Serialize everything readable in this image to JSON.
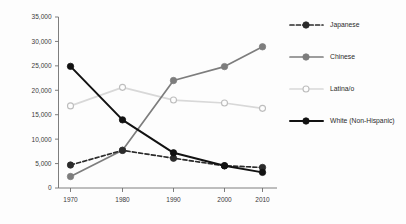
{
  "chart_data": {
    "type": "line",
    "title": "",
    "subtitle": "",
    "xlabel": "",
    "ylabel": "",
    "x": [
      1970,
      1980,
      1990,
      2000,
      2010
    ],
    "categories": [
      "1970",
      "1980",
      "1990",
      "2000",
      "2010"
    ],
    "xtick_labels": [
      "1970",
      "1980",
      "1990",
      "2000",
      "2010"
    ],
    "ytick_labels": [
      "0",
      "5,000",
      "10,000",
      "15,000",
      "20,000",
      "25,000",
      "30,000",
      "35,000"
    ],
    "ytick_values": [
      0,
      5000,
      10000,
      15000,
      20000,
      25000,
      30000,
      35000
    ],
    "ylim": [
      0,
      35000
    ],
    "xlim": [
      1965,
      2015
    ],
    "grid": false,
    "legend_position": "right",
    "series": [
      {
        "name": "Japanese",
        "values": [
          4700,
          7700,
          6100,
          4550,
          4200
        ],
        "color": "#2b2b2b",
        "style": "dashed",
        "marker": "filled-circle"
      },
      {
        "name": "Chinese",
        "values": [
          2350,
          7750,
          22000,
          24850,
          28900
        ],
        "color": "#7d7d7d",
        "style": "solid",
        "marker": "filled-circle"
      },
      {
        "name": "Latina/o",
        "values": [
          16800,
          20600,
          18000,
          17400,
          16300
        ],
        "color": "#d8d8d8",
        "style": "solid",
        "marker": "open-circle"
      },
      {
        "name": "White (Non-Hispanic)",
        "values": [
          24900,
          13950,
          7200,
          4550,
          3200
        ],
        "color": "#121212",
        "style": "solid",
        "marker": "filled-circle"
      }
    ]
  },
  "legend": {
    "items": [
      {
        "label": "Japanese"
      },
      {
        "label": "Chinese"
      },
      {
        "label": "Latina/o"
      },
      {
        "label": "White (Non-Hispanic)"
      }
    ]
  },
  "axes": {
    "y_labels": [
      "35,000",
      "30,000",
      "25,000",
      "20,000",
      "15,000",
      "10,000",
      "5,000",
      "0"
    ],
    "x_labels": [
      "1970",
      "1980",
      "1990",
      "2000",
      "2010"
    ]
  }
}
